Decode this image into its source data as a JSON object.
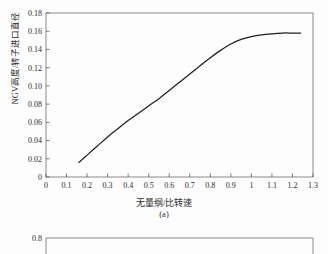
{
  "chart_data": [
    {
      "type": "line",
      "title": "",
      "caption": "(a)",
      "xlabel": "无量纲/比转速",
      "ylabel": "NGV高度/转子进口直径",
      "xlim": [
        0,
        1.3
      ],
      "ylim": [
        0,
        0.18
      ],
      "grid": false,
      "legend": null,
      "xticks": [
        "0",
        "0.1",
        "0.2",
        "0.3",
        "0.4",
        "0.5",
        "0.6",
        "0.7",
        "0.8",
        "0.9",
        "1",
        "1.1",
        "1.2",
        "1.3"
      ],
      "xtick_values": [
        0,
        0.1,
        0.2,
        0.3,
        0.4,
        0.5,
        0.6,
        0.7,
        0.8,
        0.9,
        1.0,
        1.1,
        1.2,
        1.3
      ],
      "yticks": [
        "0",
        "0.02",
        "0.04",
        "0.06",
        "0.08",
        "0.10",
        "0.12",
        "0.14",
        "0.16",
        "0.18"
      ],
      "ytick_values": [
        0,
        0.02,
        0.04,
        0.06,
        0.08,
        0.1,
        0.12,
        0.14,
        0.16,
        0.18
      ],
      "series": [
        {
          "name": "NGV height ratio",
          "color": "#231f20",
          "x": [
            0.16,
            0.2,
            0.25,
            0.3,
            0.35,
            0.4,
            0.45,
            0.5,
            0.55,
            0.6,
            0.65,
            0.7,
            0.75,
            0.8,
            0.85,
            0.9,
            0.95,
            1.0,
            1.05,
            1.1,
            1.15,
            1.2,
            1.24
          ],
          "y": [
            0.016,
            0.024,
            0.034,
            0.044,
            0.053,
            0.062,
            0.07,
            0.078,
            0.086,
            0.095,
            0.104,
            0.113,
            0.122,
            0.131,
            0.139,
            0.146,
            0.151,
            0.154,
            0.156,
            0.1572,
            0.158,
            0.158,
            0.158
          ]
        }
      ]
    },
    {
      "type": "line",
      "title": "",
      "partial": true,
      "ylim_top_label": "0.8",
      "yticks": [
        "0.8"
      ]
    }
  ],
  "figure_a": {
    "ylabel": "NGV高度/转子进口直径",
    "xlabel": "无量纲/比转速",
    "caption": "(a)"
  },
  "figure_b": {
    "top_tick": "0.8"
  }
}
